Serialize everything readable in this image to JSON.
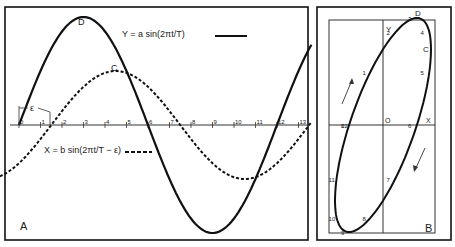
{
  "figure": {
    "panel_a": {
      "label": "A",
      "y_equation": "Y = a sin(2πt/T)",
      "x_equation": "X = b sin(2πt/T − ε)",
      "epsilon_label": "ε",
      "point_d": "D",
      "point_c": "C",
      "ticks": [
        "0",
        "1",
        "2",
        "3",
        "4",
        "5",
        "6",
        "7",
        "8",
        "9",
        "10",
        "11",
        "12",
        "13"
      ],
      "tick_left_prefix": "1",
      "tick_right_suffix": "1",
      "legend_solid": "solid line",
      "legend_dashed": "dashed line"
    },
    "panel_b": {
      "label": "B",
      "axis_y": "Y",
      "axis_x": "X",
      "origin": "O",
      "point_d": "D",
      "point_c": "C",
      "points": [
        "0",
        "1",
        "2",
        "3",
        "4",
        "5",
        "6",
        "7",
        "8",
        "9",
        "10",
        "11",
        "12",
        "13"
      ],
      "arrow_up": "direction-arrow-up",
      "arrow_down": "direction-arrow-down"
    }
  },
  "chart_data": {
    "type": "line",
    "title": "",
    "xlabel": "t",
    "ylabel": "",
    "series": [
      {
        "name": "Y = a sin(2πt/T)",
        "style": "solid",
        "amplitude": 1.0,
        "period": 12,
        "phase_units": 0
      },
      {
        "name": "X = b sin(2πt/T − ε)",
        "style": "dashed",
        "amplitude": 0.5,
        "period": 12,
        "phase_units": 1.5
      }
    ],
    "x_ticks": [
      0,
      1,
      2,
      3,
      4,
      5,
      6,
      7,
      8,
      9,
      10,
      11,
      12,
      13
    ],
    "annotations": [
      "D",
      "C",
      "ε"
    ],
    "secondary": {
      "type": "lissajous-ellipse",
      "labels": [
        "O",
        "X",
        "Y",
        "D",
        "C"
      ],
      "points_numbered": "0–13"
    }
  }
}
